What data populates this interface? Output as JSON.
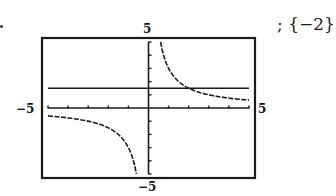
{
  "answer": {
    "solution_set": "; {−2}"
  },
  "chart_data": {
    "type": "line",
    "title": "",
    "xlabel": "",
    "ylabel": "",
    "xlim": [
      -5,
      5
    ],
    "ylim": [
      -5,
      5
    ],
    "x_tick_step": 1,
    "y_tick_step": 1,
    "grid": false,
    "window_labels": {
      "ymax": "5",
      "ymin": "−5",
      "xmin": "−5",
      "xmax": "5"
    },
    "series": [
      {
        "name": "y = -3/x",
        "style": "dashed",
        "vertical_asymptote": 0,
        "x": [
          -5,
          -4,
          -3,
          -2,
          -1.5,
          -1,
          -0.75,
          -0.6,
          0.6,
          0.75,
          1,
          1.5,
          2,
          3,
          4,
          5
        ],
        "y": [
          0.6,
          0.75,
          1,
          1.5,
          2,
          3,
          4,
          5,
          -5,
          -4,
          -3,
          -2,
          -1.5,
          -1,
          -0.75,
          -0.6
        ]
      },
      {
        "name": "y = 1.5",
        "style": "solid",
        "x": [
          -5,
          5
        ],
        "y": [
          1.5,
          1.5
        ]
      }
    ],
    "intersection": {
      "x": -2,
      "y": 1.5
    }
  }
}
